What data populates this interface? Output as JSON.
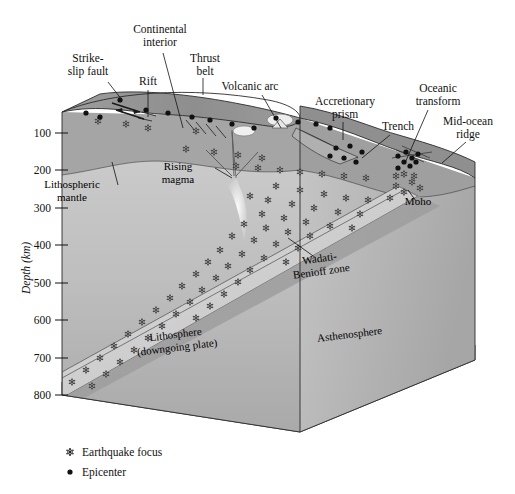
{
  "figure": {
    "kind": "block-diagram",
    "background_color": "#ffffff"
  },
  "callouts": [
    {
      "id": "strike-slip-fault",
      "label": "Strike-\nslip fault",
      "lines": [
        "Strike-",
        "slip fault"
      ],
      "x": 88,
      "y": 62,
      "anchor": "middle",
      "leader": [
        [
          108,
          82
        ],
        [
          122,
          100
        ]
      ]
    },
    {
      "id": "continental-interior",
      "label": "Continental\ninterior",
      "lines": [
        "Continental",
        "interior"
      ],
      "x": 160,
      "y": 33,
      "anchor": "middle",
      "leader": [
        [
          163,
          53
        ],
        [
          183,
          128
        ]
      ]
    },
    {
      "id": "rift",
      "label": "Rift",
      "lines": [
        "Rift"
      ],
      "x": 148,
      "y": 85,
      "anchor": "middle",
      "leader": [
        [
          148,
          90
        ],
        [
          148,
          117
        ]
      ]
    },
    {
      "id": "thrust-belt",
      "label": "Thrust\nbelt",
      "lines": [
        "Thrust",
        "belt"
      ],
      "x": 205,
      "y": 62,
      "anchor": "middle",
      "leader": [
        [
          203,
          78
        ],
        [
          203,
          95
        ]
      ]
    },
    {
      "id": "volcanic-arc",
      "label": "Volcanic arc",
      "lines": [
        "Volcanic arc"
      ],
      "x": 250,
      "y": 90,
      "anchor": "middle",
      "leader": [
        [
          262,
          95
        ],
        [
          281,
          128
        ]
      ]
    },
    {
      "id": "accretionary-prism",
      "label": "Accretionary\nprism",
      "lines": [
        "Accretionary",
        "prism"
      ],
      "x": 345,
      "y": 105,
      "anchor": "middle",
      "leader": [
        [
          343,
          122
        ],
        [
          343,
          140
        ]
      ]
    },
    {
      "id": "trench",
      "label": "Trench",
      "lines": [
        "Trench"
      ],
      "x": 398,
      "y": 130,
      "anchor": "middle",
      "leader": [
        [
          390,
          135
        ],
        [
          362,
          158
        ]
      ]
    },
    {
      "id": "oceanic-transform",
      "label": "Oceanic\ntransform",
      "lines": [
        "Oceanic",
        "transform"
      ],
      "x": 438,
      "y": 92,
      "anchor": "middle",
      "leader": [
        [
          428,
          110
        ],
        [
          405,
          163
        ]
      ]
    },
    {
      "id": "mid-ocean-ridge",
      "label": "Mid-ocean\nridge",
      "lines": [
        "Mid-ocean",
        "ridge"
      ],
      "x": 468,
      "y": 125,
      "anchor": "middle",
      "leader": [
        [
          466,
          142
        ],
        [
          442,
          163
        ]
      ]
    }
  ],
  "interior_labels": [
    {
      "id": "lithospheric-mantle",
      "lines": [
        "Lithospheric",
        "mantle"
      ],
      "x": 72,
      "y": 188,
      "rotate": 0,
      "leader": [
        [
          118,
          185
        ],
        [
          112,
          162
        ]
      ]
    },
    {
      "id": "rising-magma",
      "lines": [
        "Rising",
        "magma"
      ],
      "x": 178,
      "y": 170,
      "rotate": 0,
      "leader": [
        [
          215,
          168
        ],
        [
          232,
          178
        ]
      ]
    },
    {
      "id": "moho",
      "lines": [
        "Moho"
      ],
      "x": 418,
      "y": 205,
      "rotate": 0,
      "leader": [
        [
          416,
          201
        ],
        [
          408,
          190
        ]
      ]
    },
    {
      "id": "wadati-benioff-zone",
      "lines": [
        "Wadati-",
        "Benioff zone"
      ],
      "x": 320,
      "y": 262,
      "rotate": -8,
      "leader": [
        [
          316,
          258
        ],
        [
          288,
          238
        ]
      ]
    },
    {
      "id": "lithosphere-downgoing-plate",
      "lines": [
        "Lithosphere",
        "(downgoing plate)"
      ],
      "x": 176,
      "y": 338,
      "rotate": -7,
      "leader": null
    },
    {
      "id": "asthenosphere",
      "lines": [
        "Asthenosphere"
      ],
      "x": 350,
      "y": 338,
      "rotate": -7,
      "leader": null
    }
  ],
  "depth_axis": {
    "title": "Depth (km)",
    "title_x": 30,
    "title_y": 268,
    "unit": "km",
    "ticks": [
      {
        "value": "100",
        "y": 133
      },
      {
        "value": "200",
        "y": 170
      },
      {
        "value": "300",
        "y": 208
      },
      {
        "value": "400",
        "y": 245
      },
      {
        "value": "500",
        "y": 283
      },
      {
        "value": "600",
        "y": 320
      },
      {
        "value": "700",
        "y": 358
      },
      {
        "value": "800",
        "y": 395
      }
    ]
  },
  "legend": {
    "items": [
      {
        "id": "earthquake-focus",
        "symbol": "star",
        "label": "Earthquake focus",
        "x": 82,
        "y": 456
      },
      {
        "id": "epicenter",
        "symbol": "dot",
        "label": "Epicenter",
        "x": 82,
        "y": 476
      }
    ]
  },
  "colors": {
    "crust_top": "#9a9a9a",
    "crust_top_light": "#b9b9b9",
    "ocean_top": "#8f8f8f",
    "lithosphere_face": "#c9c9c9",
    "asthenosphere_face": "#b4b4b4",
    "slab": "#d2d2d2",
    "slab_dark": "#8d8d8d",
    "side_face": "#a8a8a8",
    "bottom_face": "#f2f2f2",
    "magma": "#efefef",
    "outline": "#2b2b2b",
    "text": "#111111"
  },
  "earthquake_foci": [
    [
      98,
      121
    ],
    [
      126,
      124
    ],
    [
      148,
      128
    ],
    [
      196,
      131
    ],
    [
      186,
      149
    ],
    [
      214,
      152
    ],
    [
      238,
      155
    ],
    [
      262,
      158
    ],
    [
      236,
      166
    ],
    [
      258,
      168
    ],
    [
      280,
      170
    ],
    [
      300,
      172
    ],
    [
      322,
      174
    ],
    [
      344,
      176
    ],
    [
      366,
      178
    ],
    [
      276,
      186
    ],
    [
      300,
      190
    ],
    [
      324,
      194
    ],
    [
      346,
      198
    ],
    [
      368,
      200
    ],
    [
      390,
      198
    ],
    [
      250,
      196
    ],
    [
      268,
      200
    ],
    [
      292,
      204
    ],
    [
      314,
      208
    ],
    [
      338,
      212
    ],
    [
      360,
      214
    ],
    [
      262,
      214
    ],
    [
      284,
      218
    ],
    [
      306,
      222
    ],
    [
      330,
      226
    ],
    [
      352,
      228
    ],
    [
      244,
      224
    ],
    [
      266,
      228
    ],
    [
      288,
      232
    ],
    [
      310,
      236
    ],
    [
      232,
      236
    ],
    [
      254,
      240
    ],
    [
      276,
      244
    ],
    [
      298,
      248
    ],
    [
      220,
      250
    ],
    [
      242,
      254
    ],
    [
      264,
      258
    ],
    [
      286,
      262
    ],
    [
      208,
      262
    ],
    [
      228,
      266
    ],
    [
      250,
      270
    ],
    [
      196,
      274
    ],
    [
      216,
      278
    ],
    [
      238,
      282
    ],
    [
      182,
      286
    ],
    [
      202,
      290
    ],
    [
      224,
      294
    ],
    [
      170,
      298
    ],
    [
      190,
      302
    ],
    [
      210,
      306
    ],
    [
      156,
      310
    ],
    [
      176,
      314
    ],
    [
      196,
      318
    ],
    [
      142,
      322
    ],
    [
      162,
      326
    ],
    [
      128,
      334
    ],
    [
      148,
      338
    ],
    [
      114,
      346
    ],
    [
      134,
      350
    ],
    [
      100,
      358
    ],
    [
      120,
      362
    ],
    [
      86,
      370
    ],
    [
      106,
      374
    ],
    [
      72,
      382
    ],
    [
      92,
      386
    ],
    [
      396,
      186
    ],
    [
      404,
      192
    ],
    [
      412,
      182
    ],
    [
      420,
      188
    ],
    [
      404,
      174
    ],
    [
      414,
      176
    ],
    [
      396,
      176
    ]
  ],
  "epicenters": [
    [
      120,
      100
    ],
    [
      146,
      110
    ],
    [
      168,
      113
    ],
    [
      192,
      117
    ],
    [
      210,
      120
    ],
    [
      232,
      124
    ],
    [
      254,
      128
    ],
    [
      276,
      118
    ],
    [
      298,
      122
    ],
    [
      316,
      124
    ],
    [
      330,
      128
    ],
    [
      336,
      148
    ],
    [
      350,
      146
    ],
    [
      362,
      152
    ],
    [
      344,
      158
    ],
    [
      356,
      162
    ],
    [
      330,
      156
    ],
    [
      398,
      156
    ],
    [
      406,
      152
    ],
    [
      412,
      158
    ],
    [
      418,
      154
    ],
    [
      404,
      162
    ],
    [
      410,
      166
    ],
    [
      398,
      168
    ],
    [
      416,
      162
    ],
    [
      100,
      117
    ],
    [
      86,
      113
    ]
  ]
}
